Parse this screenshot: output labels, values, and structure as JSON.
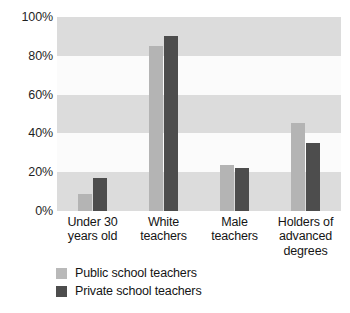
{
  "chart_data": {
    "type": "bar",
    "title": "",
    "subtitle": "",
    "xlabel": "",
    "ylabel": "",
    "ylim": [
      0,
      100
    ],
    "ytick_labels": [
      "100%",
      "80%",
      "60%",
      "40%",
      "20%",
      "0%"
    ],
    "ytick_values": [
      100,
      80,
      60,
      40,
      20,
      0
    ],
    "grid": false,
    "banded_background": true,
    "legend_position": "bottom-left",
    "categories": [
      "Under 30\nyears old",
      "White\nteachers",
      "Male\nteachers",
      "Holders of\nadvanced\ndegrees"
    ],
    "category_lines": [
      [
        "Under 30",
        "years old"
      ],
      [
        "White",
        "teachers"
      ],
      [
        "Male",
        "teachers"
      ],
      [
        "Holders of",
        "advanced",
        "degrees"
      ]
    ],
    "series": [
      {
        "name": "Public school teachers",
        "color": "#b4b4b4",
        "values": [
          9,
          85,
          23.5,
          45.5
        ]
      },
      {
        "name": "Private school teachers",
        "color": "#4d4d4d",
        "values": [
          17,
          90,
          22,
          35
        ]
      }
    ],
    "value_unit": "%"
  },
  "axis": {
    "ticks": [
      {
        "label": "100%",
        "value": 100
      },
      {
        "label": "80%",
        "value": 80
      },
      {
        "label": "60%",
        "value": 60
      },
      {
        "label": "40%",
        "value": 40
      },
      {
        "label": "20%",
        "value": 20
      },
      {
        "label": "0%",
        "value": 0
      }
    ]
  },
  "legend": {
    "items": [
      {
        "label": "Public school teachers",
        "color": "#b9b9b9"
      },
      {
        "label": "Private school teachers",
        "color": "#4d4d4d"
      }
    ]
  },
  "colors": {
    "public_bar": "#b4b4b4",
    "private_bar": "#4d4d4d",
    "band_shaded": "#dcdcdc",
    "band_light": "#fbfbfb",
    "text": "#151515",
    "page_background": "#ffffff"
  }
}
